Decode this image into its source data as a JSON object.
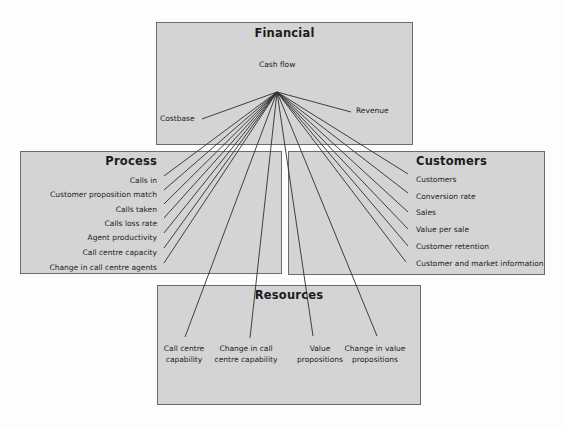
{
  "style": {
    "background": "#fdfdfd",
    "box_fill": "#d4d4d4",
    "box_border": "#6b6b6b",
    "line_color": "#2e2e2e",
    "text_color": "#1c1c1c"
  },
  "boxes": {
    "financial": {
      "title": "Financial",
      "cash_flow": "Cash flow",
      "costbase": "Costbase",
      "revenue": "Revenue"
    },
    "process": {
      "title": "Process",
      "items": [
        "Calls in",
        "Customer proposition match",
        "Calls taken",
        "Calls loss rate",
        "Agent productivity",
        "Call centre capacity",
        "Change in call centre agents"
      ]
    },
    "customers": {
      "title": "Customers",
      "items": [
        "Customers",
        "Conversion rate",
        "Sales",
        "Value per sale",
        "Customer retention",
        "Customer and market information"
      ]
    },
    "resources": {
      "title": "Resources",
      "items": [
        "Call centre\ncapability",
        "Change in call\ncentre capability",
        "Value\npropositions",
        "Change in value\npropositions"
      ]
    }
  },
  "connections": {
    "source": "Cash flow",
    "targets": [
      "Costbase",
      "Revenue",
      "Calls in",
      "Customer proposition match",
      "Calls taken",
      "Calls loss rate",
      "Agent productivity",
      "Call centre capacity",
      "Change in call centre agents",
      "Customers",
      "Conversion rate",
      "Sales",
      "Value per sale",
      "Customer retention",
      "Customer and market information",
      "Call centre capability",
      "Change in call centre capability",
      "Value propositions",
      "Change in value propositions"
    ]
  }
}
